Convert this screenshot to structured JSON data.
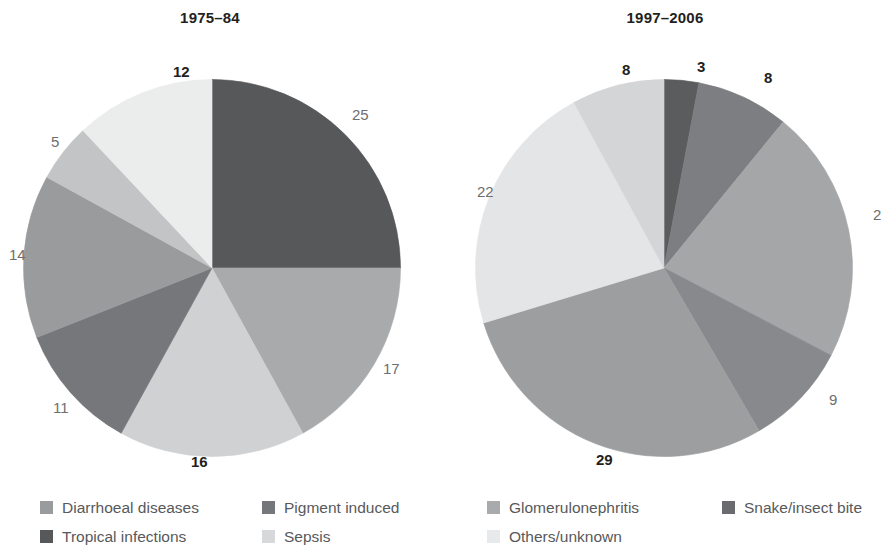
{
  "panels": [
    {
      "title": "1975–84"
    },
    {
      "title": "1997–2006"
    }
  ],
  "legend": {
    "items": [
      {
        "label": "Diarrhoeal diseases",
        "color": "#9a9b9d",
        "icon": "legend-swatch-icon"
      },
      {
        "label": "Pigment induced",
        "color": "#76777a",
        "icon": "legend-swatch-icon"
      },
      {
        "label": "Glomerulonephritis",
        "color": "#a9aaac",
        "icon": "legend-swatch-icon"
      },
      {
        "label": "Snake/insect bite",
        "color": "#6a6b6e",
        "icon": "legend-swatch-icon"
      },
      {
        "label": "Tropical infections",
        "color": "#57585a",
        "icon": "legend-swatch-icon"
      },
      {
        "label": "Sepsis",
        "color": "#d7d8da",
        "icon": "legend-swatch-icon"
      },
      {
        "label": "Others/unknown",
        "color": "#e8e9ea",
        "icon": "legend-swatch-icon"
      }
    ]
  },
  "chart_data": [
    {
      "type": "pie",
      "title": "1975–84",
      "start_angle_deg": 0,
      "direction": "clockwise",
      "units": "percent",
      "total": 100,
      "labels_bold": [
        12,
        16
      ],
      "slices": [
        {
          "category": "Tropical infections",
          "value": 25,
          "label": "25",
          "color": "#57585a",
          "bold": false,
          "label_x": 352,
          "label_y": 107
        },
        {
          "category": "Glomerulonephritis",
          "value": 17,
          "label": "17",
          "color": "#a9aaac",
          "bold": false,
          "label_x": 383,
          "label_y": 361
        },
        {
          "category": "Sepsis",
          "value": 16,
          "label": "16",
          "color": "#d0d1d3",
          "bold": true,
          "label_x": 191,
          "label_y": 454
        },
        {
          "category": "Pigment induced",
          "value": 11,
          "label": "11",
          "color": "#76777a",
          "bold": false,
          "label_x": 53,
          "label_y": 400
        },
        {
          "category": "Diarrhoeal diseases",
          "value": 14,
          "label": "14",
          "color": "#9a9b9d",
          "bold": false,
          "label_x": 9,
          "label_y": 247
        },
        {
          "category": "Snake/insect bite",
          "value": 5,
          "label": "5",
          "color": "#c3c4c6",
          "bold": false,
          "label_x": 51,
          "label_y": 134
        },
        {
          "category": "Others/unknown",
          "value": 12,
          "label": "12",
          "color": "#ebecec",
          "bold": true,
          "label_x": 173,
          "label_y": 64
        }
      ]
    },
    {
      "type": "pie",
      "title": "1997–2006",
      "start_angle_deg": 0,
      "direction": "clockwise",
      "units": "percent",
      "total": 101,
      "labels_bold": [
        8,
        3,
        8,
        29
      ],
      "slices": [
        {
          "category": "Snake/insect bite",
          "value": 3,
          "label": "3",
          "color": "#5b5c5e",
          "bold": true,
          "label_x": 697,
          "label_y": 59
        },
        {
          "category": "Tropical infections",
          "value": 8,
          "label": "8",
          "color": "#7d7e81",
          "bold": true,
          "label_x": 764,
          "label_y": 70
        },
        {
          "category": "Glomerulonephritis",
          "value": 22,
          "label": "2",
          "color": "#a5a6a8",
          "bold": false,
          "label_x": 873,
          "label_y": 207
        },
        {
          "category": "Pigment induced",
          "value": 9,
          "label": "9",
          "color": "#88898c",
          "bold": false,
          "label_x": 829,
          "label_y": 392
        },
        {
          "category": "Diarrhoeal diseases",
          "value": 29,
          "label": "29",
          "color": "#9d9ea0",
          "bold": true,
          "label_x": 596,
          "label_y": 452
        },
        {
          "category": "Others/unknown",
          "value": 22,
          "label": "22",
          "color": "#e4e5e6",
          "bold": false,
          "label_x": 477,
          "label_y": 184
        },
        {
          "category": "Sepsis",
          "value": 8,
          "label": "8",
          "color": "#d4d5d7",
          "bold": true,
          "label_x": 622,
          "label_y": 62
        }
      ]
    }
  ]
}
